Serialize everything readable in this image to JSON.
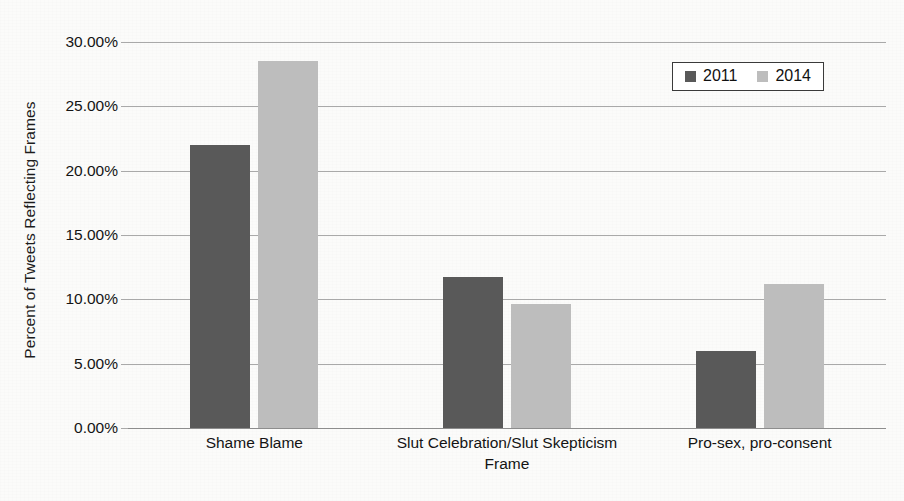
{
  "chart_data": {
    "type": "bar",
    "title": "",
    "xlabel": "Frame",
    "ylabel": "Percent of Tweets Reflecting Frames",
    "categories": [
      "Shame Blame",
      "Slut Celebration/Slut Skepticism",
      "Pro-sex, pro-consent"
    ],
    "series": [
      {
        "name": "2011",
        "color": "#595959",
        "values": [
          22.0,
          11.7,
          6.0
        ]
      },
      {
        "name": "2014",
        "color": "#bdbdbd",
        "values": [
          28.5,
          9.6,
          11.2
        ]
      }
    ],
    "ylim": [
      0,
      30
    ],
    "ytick_values": [
      30,
      25,
      20,
      15,
      10,
      5,
      0
    ],
    "ytick_labels": [
      "30.00%",
      "25.00%",
      "20.00%",
      "15.00%",
      "10.00%",
      "5.00%",
      "0.00%"
    ],
    "grid": true,
    "legend_position": "top-right",
    "value_format": "percent"
  },
  "legend": {
    "items": [
      {
        "label": "2011",
        "swatch": "legend-swatch-2011"
      },
      {
        "label": "2014",
        "swatch": "legend-swatch-2014"
      }
    ]
  }
}
